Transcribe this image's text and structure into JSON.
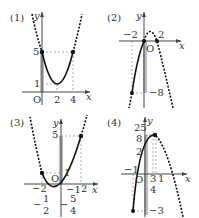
{
  "panels": [
    {
      "label": "(1)",
      "axis_x": "x",
      "axis_y": "y",
      "origin": "O",
      "ticks": {
        "y5": "5",
        "y1": "1",
        "x2": "2",
        "x4": "4"
      }
    },
    {
      "label": "(2)",
      "axis_x": "x",
      "axis_y": "y",
      "origin": "O",
      "ticks": {
        "xm2": "−2",
        "x2": "2",
        "ym8": "−8"
      }
    },
    {
      "label": "(3)",
      "axis_x": "x",
      "axis_y": "y",
      "origin": "O",
      "ticks": {
        "y5": "5",
        "y1": "1",
        "xm2": "−2",
        "x2": "2",
        "ym1": "−1",
        "half_num": "1",
        "half_den": "2",
        "half_sign": "−",
        "q_num": "5",
        "q_den": "4",
        "q_sign": "−"
      }
    },
    {
      "label": "(4)",
      "axis_x": "x",
      "axis_y": "y",
      "origin": "O",
      "ticks": {
        "top_num": "25",
        "top_den": "8",
        "y2": "2",
        "xm1": "−1",
        "x34_num": "3",
        "x34_den": "4",
        "x1": "1",
        "ym3": "−3"
      }
    }
  ],
  "colors": {
    "curve": "#111111",
    "shade": "#bdbdbd",
    "axis": "#444444",
    "guide": "#888888"
  }
}
